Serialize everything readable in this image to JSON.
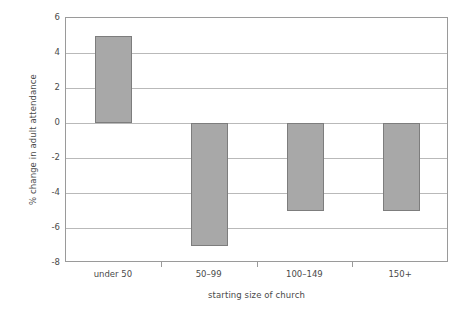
{
  "chart_data": {
    "type": "bar",
    "title": "",
    "subtitle": "",
    "xlabel": "starting size of church",
    "ylabel": "% change in adult attendance",
    "categories": [
      "under 50",
      "50–99",
      "100–149",
      "150+"
    ],
    "values": [
      5,
      -7,
      -5,
      -5
    ],
    "series": [
      {
        "name": "% change in adult attendance",
        "values": [
          5,
          -7,
          -5,
          -5
        ]
      }
    ],
    "ylim": [
      -8,
      6
    ],
    "ytick_values": [
      6,
      4,
      2,
      0,
      -2,
      -4,
      -6,
      -8
    ],
    "ytick_labels": [
      "6",
      "4",
      "2",
      "0",
      "-2",
      "-4",
      "-6",
      "-8"
    ],
    "ytick_step": 2,
    "grid": {
      "horizontal": true,
      "vertical": false,
      "color": "#b9b9b9"
    },
    "legend": {
      "visible": false,
      "position": "none",
      "entries": []
    },
    "annotations": [],
    "colors": {
      "bar_fill": "#a8a8a8",
      "bar_border": "#7d7d7d",
      "gridline": "#b9b9b9",
      "axis_line": "#9a9a9a",
      "text": "#4a4a4a",
      "background": "#ffffff"
    }
  }
}
